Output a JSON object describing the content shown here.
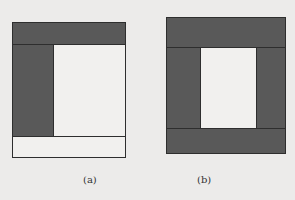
{
  "figure_a": {
    "label": "(a)",
    "description": "Rectangular frame with dark top band, dark left column, light interior and light bottom band"
  },
  "figure_b": {
    "label": "(b)",
    "description": "Rectangular frame with dark top band, dark left and right columns, dark bottom band and light interior window"
  },
  "colors": {
    "dark_fill": "#595959",
    "light_fill": "#f1f0ee",
    "outline": "#2e2e2e",
    "background": "#ecebea"
  }
}
